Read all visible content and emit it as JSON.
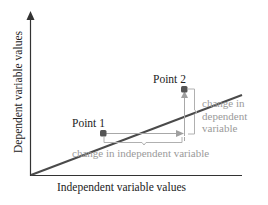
{
  "diagram": {
    "x_axis_title": "Independent variable values",
    "y_axis_title": "Dependent variable values",
    "points": [
      {
        "label": "Point 1"
      },
      {
        "label": "Point 2"
      }
    ],
    "annotations": {
      "change_independent": "change in independent variable",
      "change_dependent_lines": [
        "change in",
        "dependent",
        "variable"
      ]
    },
    "colors": {
      "axis": "#333333",
      "line": "#4a4a4a",
      "point": "#555555",
      "annotation": "#a0a0a0"
    }
  }
}
